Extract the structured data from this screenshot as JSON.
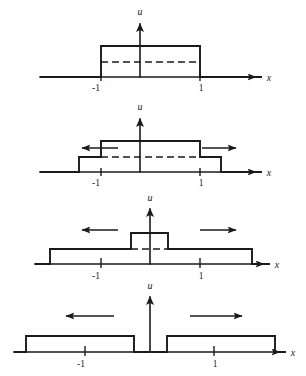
{
  "figure": {
    "axis_label_x": "x",
    "axis_label_u": "u",
    "tick_minus_one": "-1",
    "tick_one": "1",
    "ink_color": "#1a1a1a",
    "background_color": "#ffffff"
  },
  "panels": [
    {
      "name": "panel-1",
      "caption": "initial square pulse on [-1,1] of height 1",
      "axis_y": 77,
      "axis_x_start": 40,
      "axis_x_end": 262,
      "u_axis_x": 140,
      "u_axis_top": 18,
      "ticks": [
        {
          "label": "-1",
          "x": 101
        },
        {
          "label": "1",
          "x": 200
        }
      ],
      "levels": {
        "full": 46,
        "half": 62
      },
      "profile": "M40,77 L101,77 L101,46 L200,46 L200,77 L262,77",
      "dashed": "M101,62 L200,62",
      "arrows": []
    },
    {
      "name": "panel-2",
      "caption": "pulse begins to split: centre at full height, half-height shoulders spreading",
      "axis_y": 172,
      "axis_x_start": 40,
      "axis_x_end": 262,
      "u_axis_x": 140,
      "u_axis_top": 113,
      "ticks": [
        {
          "label": "-1",
          "x": 101
        },
        {
          "label": "1",
          "x": 200
        }
      ],
      "levels": {
        "full": 141,
        "half": 157
      },
      "profile": "M40,172 L79,172 L79,157 L101,157 L101,141 L200,141 L200,157 L221,157 L221,172 L262,172",
      "dashed": "M101,157 L200,157",
      "arrows": [
        {
          "name": "left-arrow",
          "direction": "left",
          "x1": 118,
          "x2": 78,
          "y": 148
        },
        {
          "name": "right-arrow",
          "direction": "right",
          "x1": 202,
          "x2": 240,
          "y": 148
        }
      ]
    },
    {
      "name": "panel-3",
      "caption": "overlap shrinking: narrow full-height core on a wide half-height plateau",
      "axis_y": 264,
      "axis_x_start": 35,
      "axis_x_end": 270,
      "u_axis_x": 150,
      "u_axis_top": 203,
      "ticks": [
        {
          "label": "-1",
          "x": 101
        },
        {
          "label": "1",
          "x": 200
        }
      ],
      "levels": {
        "full": 233,
        "half": 249
      },
      "profile": "M35,264 L50,264 L50,249 L131,249 L131,233 L168,233 L168,249 L252,249 L252,264 L270,264",
      "dashed": "M131,249 L168,249",
      "arrows": [
        {
          "name": "left-arrow",
          "direction": "left",
          "x1": 118,
          "x2": 78,
          "y": 230
        },
        {
          "name": "right-arrow",
          "direction": "right",
          "x1": 200,
          "x2": 240,
          "y": 230
        }
      ]
    },
    {
      "name": "panel-4",
      "caption": "two separated half-height pulses travelling apart",
      "axis_y": 352,
      "axis_x_start": 14,
      "axis_x_end": 286,
      "u_axis_x": 150,
      "u_axis_top": 291,
      "ticks": [
        {
          "label": "-1",
          "x": 85
        },
        {
          "label": "1",
          "x": 214
        }
      ],
      "levels": {
        "half": 336
      },
      "profile_left": "M14,352 L26,352 L26,336 L134,336 L134,352 L149,352",
      "profile_right": "M151,352 L167,352 L167,336 L275,336 L275,352 L286,352",
      "dashed": "",
      "arrows": [
        {
          "name": "left-arrow",
          "direction": "left",
          "x1": 114,
          "x2": 62,
          "y": 316
        },
        {
          "name": "right-arrow",
          "direction": "right",
          "x1": 190,
          "x2": 246,
          "y": 316
        }
      ]
    }
  ]
}
